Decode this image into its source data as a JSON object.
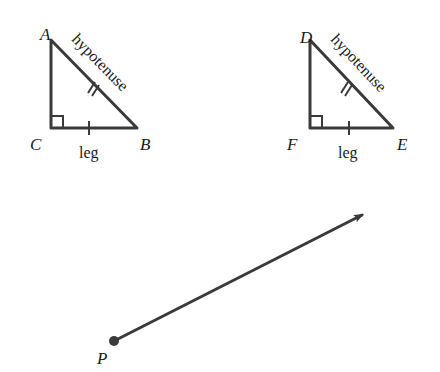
{
  "diagram": {
    "triangles": [
      {
        "vertices": {
          "top": {
            "label": "A",
            "x": 51,
            "y": 40
          },
          "right_angle": {
            "label": "C",
            "x": 51,
            "y": 128
          },
          "base_end": {
            "label": "B",
            "x": 137,
            "y": 128
          }
        },
        "hypotenuse_label": "hypotenuse",
        "leg_label": "leg",
        "hypotenuse_tick_marks": 2,
        "leg_tick_marks": 1,
        "right_angle_marker": true
      },
      {
        "vertices": {
          "top": {
            "label": "D",
            "x": 310,
            "y": 40
          },
          "right_angle": {
            "label": "F",
            "x": 310,
            "y": 128
          },
          "base_end": {
            "label": "E",
            "x": 393,
            "y": 128
          }
        },
        "hypotenuse_label": "hypotenuse",
        "leg_label": "leg",
        "hypotenuse_tick_marks": 2,
        "leg_tick_marks": 1,
        "right_angle_marker": true
      }
    ],
    "ray": {
      "start": {
        "label": "P",
        "x": 114,
        "y": 341
      },
      "end": {
        "x": 364,
        "y": 214
      }
    },
    "colors": {
      "stroke": "#3a3a3a",
      "text": "#1a1a1a",
      "background": "#ffffff"
    }
  }
}
